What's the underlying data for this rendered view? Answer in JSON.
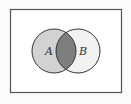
{
  "diagram": {
    "type": "venn",
    "universe": {
      "x": 10,
      "y": 9,
      "width": 111,
      "height": 83,
      "stroke": "#555555",
      "fill": "#ffffff"
    },
    "sets": [
      {
        "label": "A",
        "cx": 54,
        "cy": 51,
        "r": 22,
        "fill": "#d2d2d2",
        "label_x": 48,
        "label_y": 55
      },
      {
        "label": "B",
        "cx": 78,
        "cy": 51,
        "r": 22,
        "fill": "#f2f2f2",
        "label_x": 82,
        "label_y": 55
      }
    ],
    "intersection": {
      "fill": "#7e7e7e",
      "shaded": "A ∩ B"
    },
    "stroke": "#333333"
  }
}
